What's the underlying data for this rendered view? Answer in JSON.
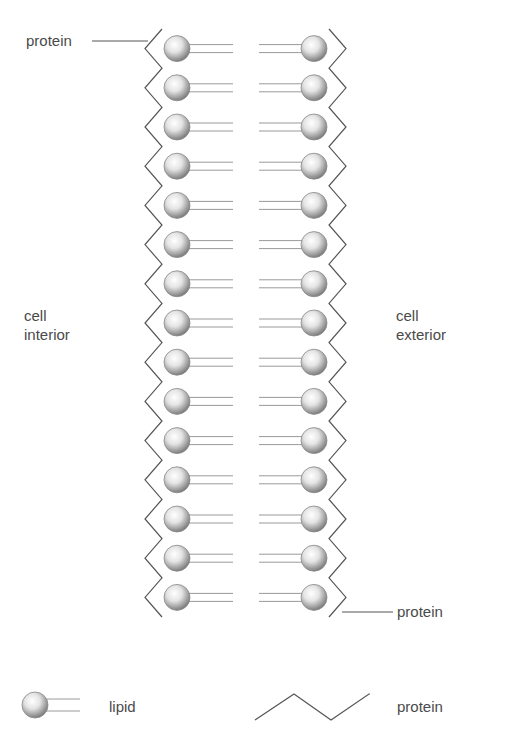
{
  "diagram": {
    "type": "membrane-bilayer",
    "rows": 15,
    "labels": {
      "protein_top": "protein",
      "protein_bottom": "protein",
      "interior_line1": "cell",
      "interior_line2": "interior",
      "exterior_line1": "cell",
      "exterior_line2": "exterior"
    },
    "legend": {
      "lipid_label": "lipid",
      "protein_label": "protein"
    },
    "colors": {
      "line": "#555555",
      "head_light": "#ffffff",
      "head_dark": "#8a8a8a",
      "tail": "#9a9a9a"
    }
  }
}
